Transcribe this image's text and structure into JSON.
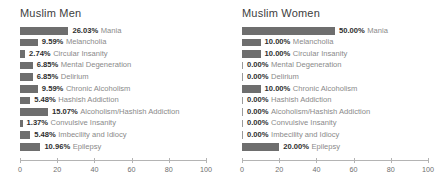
{
  "chart_data": [
    {
      "type": "bar",
      "orientation": "horizontal",
      "title": "Muslim Men",
      "xlabel": "",
      "ylabel": "",
      "xlim": [
        0,
        100
      ],
      "xticks": [
        0,
        20,
        40,
        60,
        80,
        100
      ],
      "grid": false,
      "legend": "none",
      "bar_color": "#6e6e6e",
      "categories": [
        "Mania",
        "Melancholia",
        "Circular Insanity",
        "Mental Degeneration",
        "Delirium",
        "Chronic Alcoholism",
        "Hashish Addiction",
        "Alcoholism/Hashish Addiction",
        "Convulsive Insanity",
        "Imbecility and Idiocy",
        "Epilepsy"
      ],
      "values": [
        26.03,
        9.59,
        2.74,
        6.85,
        6.85,
        9.59,
        5.48,
        15.07,
        1.37,
        5.48,
        10.96
      ],
      "value_labels": [
        "26.03%",
        "9.59%",
        "2.74%",
        "6.85%",
        "6.85%",
        "9.59%",
        "5.48%",
        "15.07%",
        "1.37%",
        "5.48%",
        "10.96%"
      ]
    },
    {
      "type": "bar",
      "orientation": "horizontal",
      "title": "Muslim Women",
      "xlabel": "",
      "ylabel": "",
      "xlim": [
        0,
        100
      ],
      "xticks": [
        0,
        20,
        40,
        60,
        80,
        100
      ],
      "grid": false,
      "legend": "none",
      "bar_color": "#6e6e6e",
      "categories": [
        "Mania",
        "Melancholia",
        "Circular Insanity",
        "Mental Degeneration",
        "Delirium",
        "Chronic Alcoholism",
        "Hashish Addiction",
        "Alcoholism/Hashish Addiction",
        "Convulsive Insanity",
        "Imbecility and Idiocy",
        "Epilepsy"
      ],
      "values": [
        50.0,
        10.0,
        10.0,
        0.0,
        0.0,
        10.0,
        0.0,
        0.0,
        0.0,
        0.0,
        20.0
      ],
      "value_labels": [
        "50.00%",
        "10.00%",
        "10.00%",
        "0.00%",
        "0.00%",
        "10.00%",
        "0.00%",
        "0.00%",
        "0.00%",
        "0.00%",
        "20.00%"
      ]
    }
  ]
}
